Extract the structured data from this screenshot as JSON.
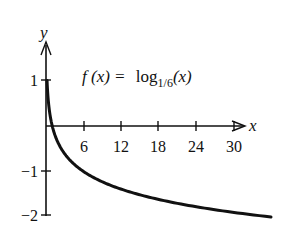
{
  "chart_data": {
    "type": "line",
    "title": "",
    "annotation": {
      "lhs": "f (x) =",
      "func": "log",
      "base": "1/6",
      "arg": "(x)"
    },
    "xlabel": "x",
    "ylabel": "y",
    "x_ticks": [
      6,
      12,
      18,
      24,
      30
    ],
    "x_tick_labels": [
      "6",
      "12",
      "18",
      "24",
      "30"
    ],
    "y_ticks": [
      1,
      -1,
      -2
    ],
    "y_tick_labels": [
      "1",
      "−1",
      "−2"
    ],
    "xlim": [
      0,
      36
    ],
    "ylim": [
      -2,
      1.5
    ],
    "grid": false,
    "legend": null,
    "series": [
      {
        "name": "f(x) = log_{1/6}(x)",
        "x": [
          0.0,
          0.2,
          0.5,
          1,
          2,
          4,
          6,
          9,
          12,
          18,
          24,
          30,
          36
        ],
        "y": [
          1.0,
          0.9,
          0.39,
          0,
          -0.39,
          -0.77,
          -1,
          -1.23,
          -1.39,
          -1.61,
          -1.77,
          -1.9,
          -2.0
        ]
      }
    ],
    "color": "#111111"
  }
}
